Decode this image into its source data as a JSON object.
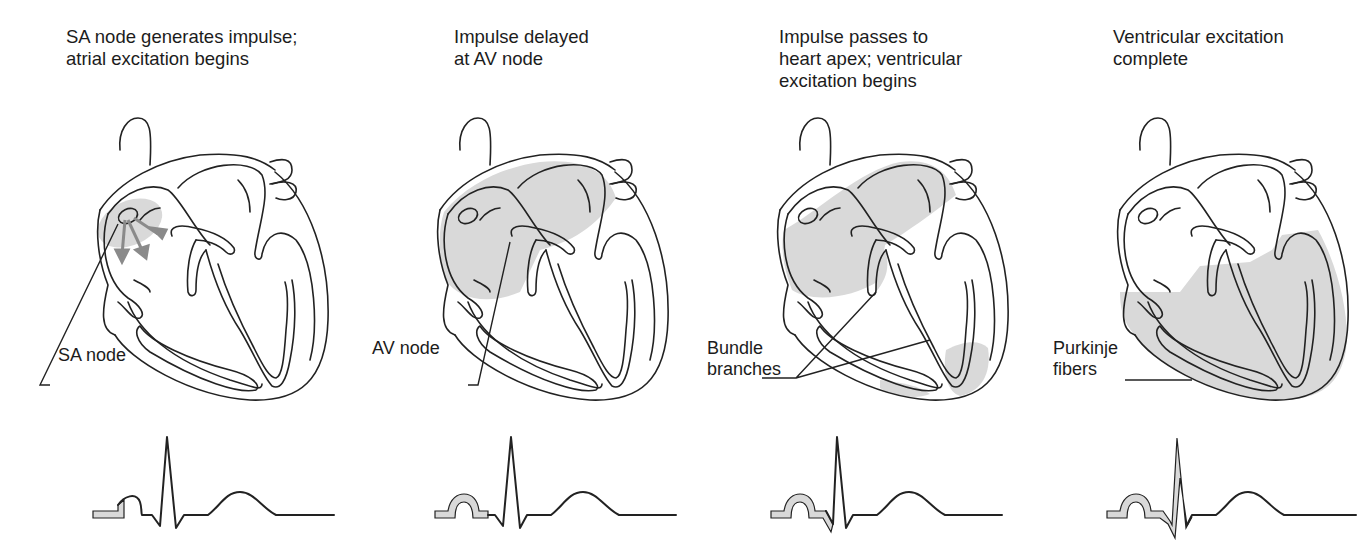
{
  "figure": {
    "fill_color": "#d9d9d9",
    "outline_color": "#222222",
    "arrow_color": "#8a8a8a",
    "panels": [
      {
        "caption": [
          "SA node generates impulse;",
          "atrial excitation begins"
        ],
        "label": [
          "SA node"
        ],
        "highlight": "sa-node-region",
        "ecg_highlight": "start-of-p-wave"
      },
      {
        "caption": [
          "Impulse delayed",
          "at AV node"
        ],
        "label": [
          "AV node"
        ],
        "highlight": "atria",
        "ecg_highlight": "p-wave"
      },
      {
        "caption": [
          "Impulse passes to",
          "heart apex; ventricular",
          "excitation begins"
        ],
        "label": [
          "Bundle",
          "branches"
        ],
        "highlight": "atria-septum-apex",
        "ecg_highlight": "p-wave-and-q"
      },
      {
        "caption": [
          "Ventricular excitation",
          "complete"
        ],
        "label": [
          "Purkinje",
          "fibers"
        ],
        "highlight": "ventricles",
        "ecg_highlight": "p-wave-and-qrs"
      }
    ]
  }
}
